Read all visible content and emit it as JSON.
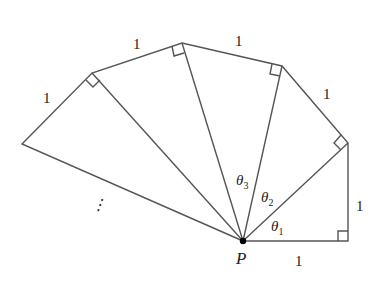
{
  "diagram": {
    "center_label": "P",
    "side_labels": [
      "1",
      "1",
      "1",
      "1",
      "1",
      "1"
    ],
    "angle_labels": [
      {
        "symbol": "θ",
        "sub": "1"
      },
      {
        "symbol": "θ",
        "sub": "2"
      },
      {
        "symbol": "θ",
        "sub": "3"
      }
    ],
    "continuation": "⋮",
    "line_color": "#555555",
    "point": {
      "x": 243,
      "y": 241
    },
    "vertices": [
      {
        "x": 348,
        "y": 241
      },
      {
        "x": 348,
        "y": 143
      },
      {
        "x": 282,
        "y": 66
      },
      {
        "x": 182,
        "y": 43
      },
      {
        "x": 92,
        "y": 73
      },
      {
        "x": 22,
        "y": 144
      }
    ]
  }
}
